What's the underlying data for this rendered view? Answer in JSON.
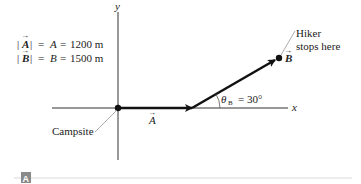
{
  "diagram": {
    "axes": {
      "x_label": "x",
      "y_label": "y"
    },
    "magnitudes": {
      "line1": {
        "vec": "A",
        "scalar": "A",
        "value": "1200 m",
        "eq": "="
      },
      "line2": {
        "vec": "B",
        "scalar": "B",
        "value": "1500 m",
        "eq": "="
      }
    },
    "vectors": {
      "A": {
        "label": "A"
      },
      "B": {
        "label": "B"
      }
    },
    "angle": {
      "symbol": "θ",
      "subscript": "B",
      "value": "= 30°"
    },
    "annotations": {
      "origin": "Campsite",
      "endpoint_line1": "Hiker",
      "endpoint_line2": "stops here"
    },
    "panel_label": "A",
    "colors": {
      "vector": "#111111",
      "axis": "#333333",
      "leader": "#888888",
      "panel_badge": "#8a8a8a",
      "divider": "#cfcfcf"
    }
  }
}
